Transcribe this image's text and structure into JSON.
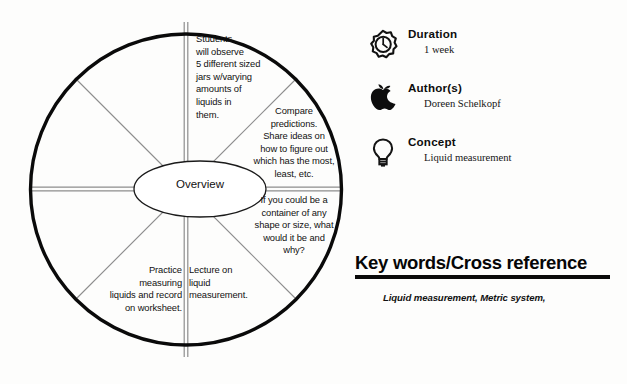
{
  "wheel": {
    "center_label": "Overview",
    "segments": [
      {
        "id": "observe",
        "text": "Students\nwill observe\n5 different sized\njars w/varying\namounts of\nliquids in\nthem."
      },
      {
        "id": "compare",
        "text": "Compare\npredictions.\nShare ideas on\nhow to figure out\nwhich has the most,\nleast, etc."
      },
      {
        "id": "container",
        "text": "If you could be a\ncontainer of any\nshape or size, what\nwould it be and\nwhy?"
      },
      {
        "id": "lecture",
        "text": "Lecture on\nliquid\nmeasurement."
      },
      {
        "id": "practice",
        "text": "Practice\nmeasuring\nliquids and record\non worksheet."
      }
    ]
  },
  "meta": {
    "items": [
      {
        "icon": "stopwatch-icon",
        "title": "Duration",
        "value": "1 week"
      },
      {
        "icon": "apple-icon",
        "title": "Author(s)",
        "value": "Doreen Schelkopf"
      },
      {
        "icon": "lightbulb-icon",
        "title": "Concept",
        "value": "Liquid measurement"
      }
    ]
  },
  "keywords": {
    "heading": "Key words/Cross reference",
    "value": "Liquid measurement, Metric system,"
  },
  "colors": {
    "ink": "#0a0a0a",
    "spoke_gray": "#8f8f8f",
    "background": "#fdfdfc"
  }
}
